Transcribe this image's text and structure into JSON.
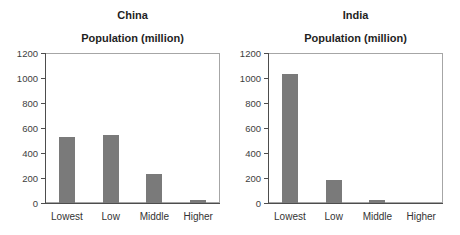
{
  "page": {
    "background": "#ffffff"
  },
  "colors": {
    "bar": "#7a7a7a",
    "axis": "#4d4d4d",
    "plot_border": "#a6a6a6",
    "title_text": "#1f1f1f",
    "tick_text": "#3d3d3d"
  },
  "chart_data": [
    {
      "type": "bar",
      "title": "China",
      "subtitle": "Population (million)",
      "categories": [
        "Lowest",
        "Low",
        "Middle",
        "Higher"
      ],
      "values": [
        530,
        540,
        230,
        20
      ],
      "xlabel": "",
      "ylabel": "Population (million)",
      "ylim": [
        0,
        1200
      ],
      "yticks": [
        0,
        200,
        400,
        600,
        800,
        1000,
        1200
      ],
      "grid": false,
      "legend": "none",
      "bar_color": "#7a7a7a"
    },
    {
      "type": "bar",
      "title": "India",
      "subtitle": "Population (million)",
      "categories": [
        "Lowest",
        "Low",
        "Middle",
        "Higher"
      ],
      "values": [
        1030,
        180,
        20,
        0
      ],
      "xlabel": "",
      "ylabel": "Population (million)",
      "ylim": [
        0,
        1200
      ],
      "yticks": [
        0,
        200,
        400,
        600,
        800,
        1000,
        1200
      ],
      "grid": false,
      "legend": "none",
      "bar_color": "#7a7a7a"
    }
  ]
}
